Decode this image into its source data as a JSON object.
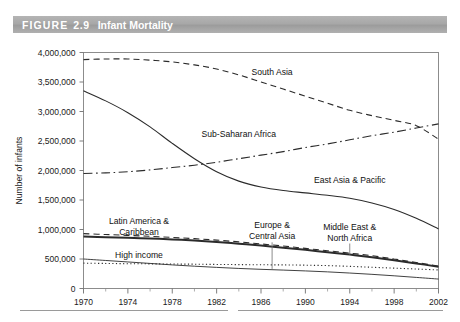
{
  "figure": {
    "label": "FIGURE",
    "number": "2.9",
    "title": "Infant Mortality"
  },
  "chart_data": {
    "type": "line",
    "title": "Infant Mortality",
    "xlabel": "",
    "ylabel": "Number of infants",
    "xlim": [
      1970,
      2002
    ],
    "ylim": [
      0,
      4000000
    ],
    "xticks": [
      1970,
      1974,
      1978,
      1982,
      1986,
      1990,
      1994,
      1998,
      2002
    ],
    "xtick_labels": [
      "1970",
      "1974",
      "1978",
      "1982",
      "1986",
      "1990",
      "1994",
      "1998",
      "2002"
    ],
    "xminor_step": 2,
    "yticks": [
      0,
      500000,
      1000000,
      1500000,
      2000000,
      2500000,
      3000000,
      3500000,
      4000000
    ],
    "ytick_labels": [
      "0",
      "500,000",
      "1,000,000",
      "1,500,000",
      "2,000,000",
      "2,500,000",
      "3,000,000",
      "3,500,000",
      "4,000,000"
    ],
    "grid": false,
    "legend_position": "inline-annotations",
    "x": [
      1970,
      1972,
      1974,
      1976,
      1978,
      1980,
      1982,
      1984,
      1986,
      1988,
      1990,
      1992,
      1994,
      1996,
      1998,
      2000,
      2002
    ],
    "series": [
      {
        "name": "South Asia",
        "style": "dashed",
        "label_x": 1987,
        "label_y": 3620000,
        "values": [
          3880000,
          3890000,
          3890000,
          3870000,
          3840000,
          3790000,
          3720000,
          3620000,
          3500000,
          3380000,
          3260000,
          3140000,
          3020000,
          2930000,
          2850000,
          2760000,
          2530000
        ]
      },
      {
        "name": "Sub-Saharan Africa",
        "style": "dash-dot",
        "label_x": 1984,
        "label_y": 2570000,
        "values": [
          1950000,
          1960000,
          1980000,
          2010000,
          2050000,
          2090000,
          2140000,
          2200000,
          2260000,
          2320000,
          2390000,
          2450000,
          2520000,
          2590000,
          2650000,
          2720000,
          2790000
        ]
      },
      {
        "name": "East Asia & Pacific",
        "style": "solid",
        "label_x": 1994,
        "label_y": 1780000,
        "values": [
          3350000,
          3180000,
          2980000,
          2740000,
          2460000,
          2200000,
          1980000,
          1820000,
          1720000,
          1660000,
          1620000,
          1580000,
          1530000,
          1450000,
          1340000,
          1190000,
          1010000
        ]
      },
      {
        "name": "Latin America & Caribbean",
        "style": "dashed",
        "label_x": 1975,
        "label_y": 1090000,
        "values": [
          930000,
          915000,
          900000,
          885000,
          865000,
          845000,
          820000,
          790000,
          755000,
          720000,
          680000,
          640000,
          600000,
          555000,
          500000,
          440000,
          380000
        ]
      },
      {
        "name": "Middle East & North Africa",
        "style": "thick-solid",
        "label_x": 1994,
        "label_y": 1000000,
        "values": [
          880000,
          870000,
          860000,
          848000,
          832000,
          812000,
          788000,
          760000,
          728000,
          692000,
          655000,
          615000,
          575000,
          530000,
          480000,
          425000,
          370000
        ]
      },
      {
        "name": "Europe & Central Asia",
        "style": "dotted",
        "label_x": 1987,
        "label_y": 1020000,
        "values": [
          430000,
          425000,
          420000,
          418000,
          415000,
          412000,
          408000,
          405000,
          402000,
          400000,
          395000,
          388000,
          375000,
          360000,
          345000,
          330000,
          315000
        ]
      },
      {
        "name": "High income",
        "style": "thin-solid",
        "label_x": 1975,
        "label_y": 520000,
        "values": [
          500000,
          475000,
          450000,
          425000,
          400000,
          378000,
          358000,
          340000,
          325000,
          312000,
          298000,
          282000,
          262000,
          240000,
          215000,
          188000,
          160000
        ]
      }
    ]
  }
}
